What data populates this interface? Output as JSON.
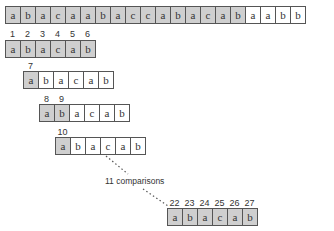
{
  "text": {
    "row": [
      "a",
      "b",
      "a",
      "c",
      "a",
      "a",
      "b",
      "a",
      "c",
      "c",
      "a",
      "b",
      "a",
      "c",
      "a",
      "b",
      "a",
      "a",
      "b",
      "b"
    ],
    "text_shaded": [
      true,
      true,
      true,
      true,
      true,
      true,
      true,
      true,
      true,
      true,
      true,
      true,
      true,
      true,
      true,
      true,
      false,
      false,
      false,
      false
    ]
  },
  "pattern_attempts": [
    {
      "labels": [
        "1",
        "2",
        "3",
        "4",
        "5",
        "6"
      ],
      "label_offsets": [
        0,
        1,
        2,
        3,
        4,
        5
      ],
      "cells": [
        "a",
        "b",
        "a",
        "c",
        "a",
        "b"
      ],
      "shaded": [
        true,
        true,
        true,
        true,
        true,
        true
      ]
    },
    {
      "labels": [
        "7"
      ],
      "label_offsets": [
        0
      ],
      "cells": [
        "a",
        "b",
        "a",
        "c",
        "a",
        "b"
      ],
      "shaded": [
        true,
        false,
        false,
        false,
        false,
        false
      ]
    },
    {
      "labels": [
        "8",
        "9"
      ],
      "label_offsets": [
        0,
        1
      ],
      "cells": [
        "a",
        "b",
        "a",
        "c",
        "a",
        "b"
      ],
      "shaded": [
        true,
        true,
        false,
        false,
        false,
        false
      ]
    },
    {
      "labels": [
        "10"
      ],
      "label_offsets": [
        0
      ],
      "cells": [
        "a",
        "b",
        "a",
        "c",
        "a",
        "b"
      ],
      "shaded": [
        true,
        false,
        false,
        false,
        false,
        false
      ]
    },
    {
      "labels": [
        "22",
        "23",
        "24",
        "25",
        "26",
        "27"
      ],
      "label_offsets": [
        0,
        1,
        2,
        3,
        4,
        5
      ],
      "cells": [
        "a",
        "b",
        "a",
        "c",
        "a",
        "b"
      ],
      "shaded": [
        true,
        true,
        true,
        true,
        true,
        true
      ]
    }
  ],
  "annotation": {
    "comparisons_label": "11 comparisons"
  },
  "colors": {
    "shaded": "#cfcfcf",
    "border": "#555555",
    "text": "#333333"
  }
}
